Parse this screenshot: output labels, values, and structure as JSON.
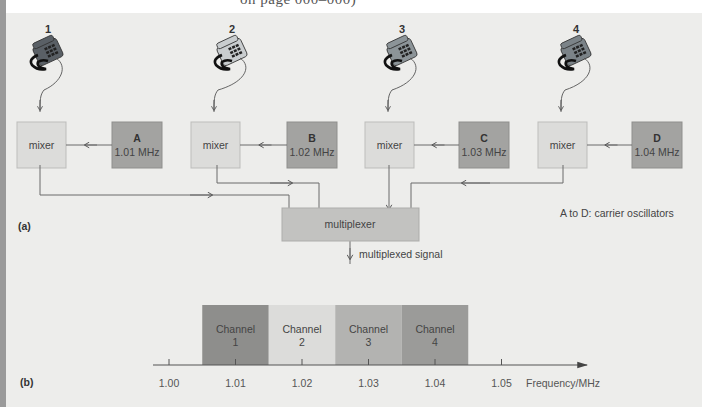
{
  "page_header_fragment": "on page 000–000)",
  "part_a": {
    "label": "(a)",
    "phones": [
      {
        "number": "1",
        "shade": "#5a6066"
      },
      {
        "number": "2",
        "shade": "#c9cdcf"
      },
      {
        "number": "3",
        "shade": "#8c9498"
      },
      {
        "number": "4",
        "shade": "#7b8388"
      }
    ],
    "mixers": [
      {
        "label": "mixer"
      },
      {
        "label": "mixer"
      },
      {
        "label": "mixer"
      },
      {
        "label": "mixer"
      }
    ],
    "oscillators": [
      {
        "letter": "A",
        "frequency": "1.01 MHz"
      },
      {
        "letter": "B",
        "frequency": "1.02 MHz"
      },
      {
        "letter": "C",
        "frequency": "1.03 MHz"
      },
      {
        "letter": "D",
        "frequency": "1.04 MHz"
      }
    ],
    "multiplexer_label": "multiplexer",
    "output_label": "multiplexed signal",
    "legend_note": "A to D: carrier oscillators"
  },
  "part_b": {
    "label": "(b)"
  },
  "colors": {
    "panel_bg": "#ededeb",
    "mixer_fill": "#dcdcda",
    "oscillator_fill": "#a3a3a1",
    "multiplexer_fill": "#c2c2c0",
    "line": "#6a6a6a"
  },
  "chart_data": {
    "type": "bar",
    "title": "",
    "xlabel": "Frequency/MHz",
    "ylabel": "",
    "x_ticks": [
      "1.00",
      "1.01",
      "1.02",
      "1.03",
      "1.04",
      "1.05"
    ],
    "xlim": [
      1.0,
      1.055
    ],
    "bands": [
      {
        "label_line1": "Channel",
        "label_line2": "1",
        "center_mhz": 1.01,
        "from_mhz": 1.005,
        "to_mhz": 1.015,
        "color": "#8e8e8c"
      },
      {
        "label_line1": "Channel",
        "label_line2": "2",
        "center_mhz": 1.02,
        "from_mhz": 1.015,
        "to_mhz": 1.025,
        "color": "#dcdcda"
      },
      {
        "label_line1": "Channel",
        "label_line2": "3",
        "center_mhz": 1.03,
        "from_mhz": 1.025,
        "to_mhz": 1.035,
        "color": "#b3b3b1"
      },
      {
        "label_line1": "Channel",
        "label_line2": "4",
        "center_mhz": 1.04,
        "from_mhz": 1.035,
        "to_mhz": 1.045,
        "color": "#9b9b99"
      }
    ],
    "grid": false,
    "legend": "none"
  }
}
